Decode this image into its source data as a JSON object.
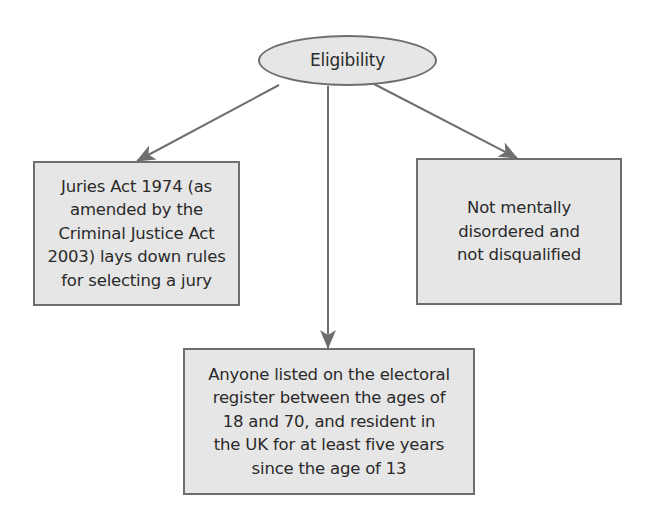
{
  "diagram": {
    "type": "flowchart",
    "colors": {
      "node_fill": "#e6e6e6",
      "node_border": "#6e6e6e",
      "connector": "#6e6e6e",
      "text": "#2a2a2a"
    },
    "root": {
      "shape": "ellipse",
      "label": "Eligibility"
    },
    "children": [
      {
        "id": "left",
        "shape": "rectangle",
        "label": "Juries Act 1974 (as\namended by the\nCriminal Justice Act\n2003) lays down rules\nfor selecting a jury"
      },
      {
        "id": "bottom",
        "shape": "rectangle",
        "label": "Anyone listed on the electoral\nregister between the ages of\n18 and 70, and resident in\nthe UK for at least five years\nsince the age of 13"
      },
      {
        "id": "right",
        "shape": "rectangle",
        "label": "Not mentally\ndisordered and\nnot disqualified"
      }
    ],
    "edges": [
      {
        "from": "root",
        "to": "left"
      },
      {
        "from": "root",
        "to": "bottom"
      },
      {
        "from": "root",
        "to": "right"
      }
    ]
  }
}
